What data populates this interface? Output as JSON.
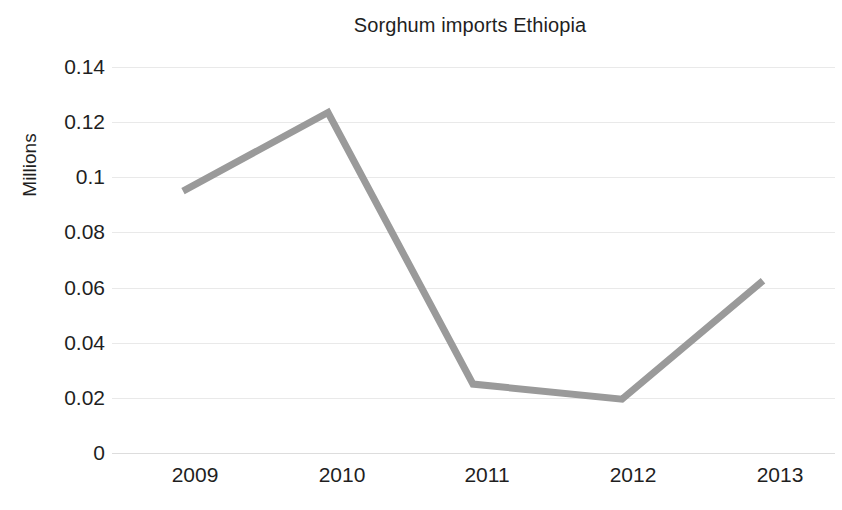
{
  "chart_data": {
    "type": "line",
    "title": "Sorghum imports Ethiopia",
    "xlabel": "",
    "ylabel": "Millions",
    "categories": [
      "2009",
      "2010",
      "2011",
      "2012",
      "2013"
    ],
    "x": [
      2009,
      2010,
      2011,
      2012,
      2013
    ],
    "values": [
      0.095,
      0.1235,
      0.025,
      0.0195,
      0.0625
    ],
    "series": [
      {
        "name": "Sorghum imports Ethiopia",
        "values": [
          0.095,
          0.1235,
          0.025,
          0.0195,
          0.0625
        ],
        "color": "#9a9a9a"
      }
    ],
    "ylim": [
      0,
      0.15
    ],
    "ytick_labels": [
      "0.14",
      "0.12",
      "0.1",
      "0.08",
      "0.06",
      "0.04",
      "0.02",
      "0"
    ],
    "ytick_values": [
      0.14,
      0.12,
      0.1,
      0.08,
      0.06,
      0.04,
      0.02,
      0
    ],
    "grid": true,
    "grid_axis": "y",
    "legend": false,
    "legend_position": "none",
    "line_color": "#9a9a9a",
    "line_width": 7,
    "markers": false,
    "background": "#ffffff",
    "gridline_color": "#e9e9e9"
  },
  "chart": {
    "title": "Sorghum imports Ethiopia",
    "y_axis_title": "Millions"
  }
}
